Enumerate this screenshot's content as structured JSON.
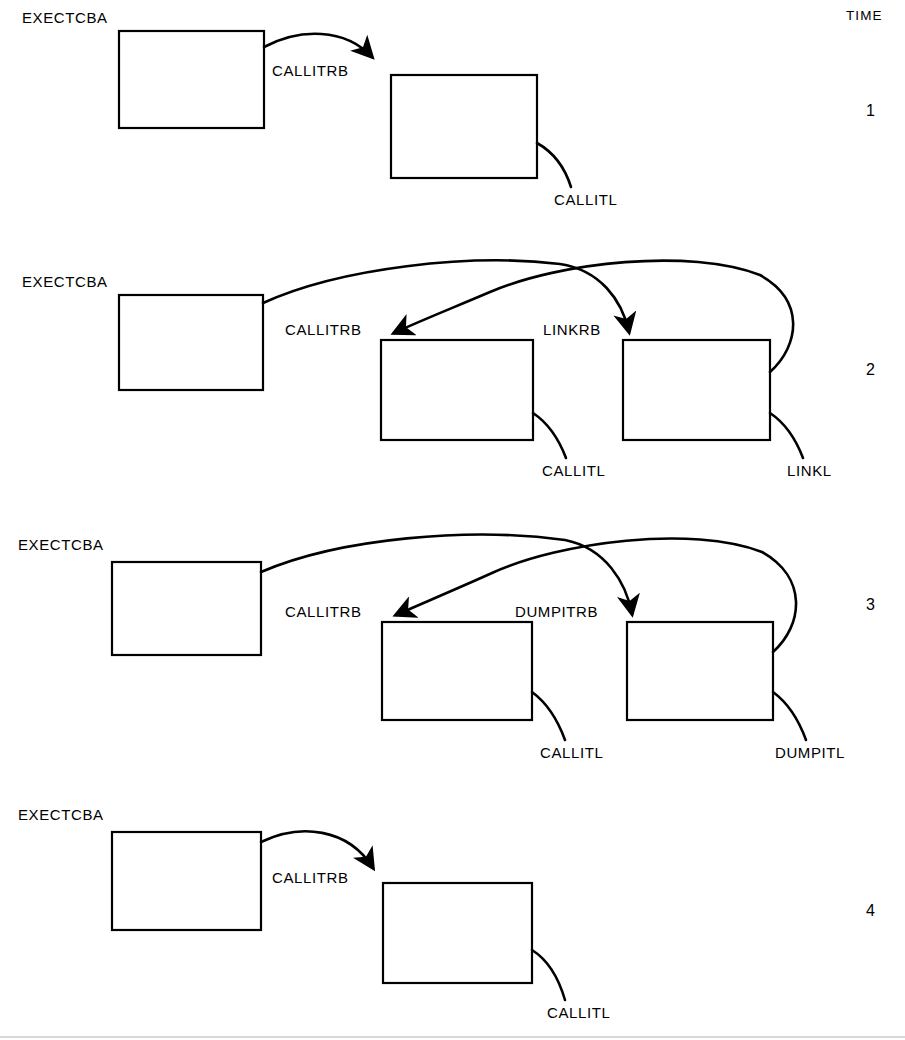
{
  "diagram": {
    "title_column": "TIME",
    "type": "control-block-sequence",
    "line_color": "#000000",
    "background": "#ffffff",
    "rows": [
      {
        "time": "1",
        "origin_label": "EXECTCBA",
        "boxes": [
          {
            "name": "exec-tcb-box",
            "x": 119,
            "y": 31,
            "w": 145,
            "h": 97
          },
          {
            "name": "request-block-box",
            "x": 391,
            "y": 75,
            "w": 146,
            "h": 103
          }
        ],
        "arc_labels": [
          "CALLITRB"
        ],
        "tail_labels": [
          "CALLITL"
        ]
      },
      {
        "time": "2",
        "origin_label": "EXECTCBA",
        "boxes": [
          {
            "name": "exec-tcb-box",
            "x": 119,
            "y": 295,
            "w": 144,
            "h": 95
          },
          {
            "name": "call-request-block-box",
            "x": 381,
            "y": 340,
            "w": 152,
            "h": 100
          },
          {
            "name": "link-request-block-box",
            "x": 623,
            "y": 340,
            "w": 147,
            "h": 100
          }
        ],
        "arc_labels": [
          "CALLITRB",
          "LINKRB"
        ],
        "tail_labels": [
          "CALLITL",
          "LINKL"
        ]
      },
      {
        "time": "3",
        "origin_label": "EXECTCBA",
        "boxes": [
          {
            "name": "exec-tcb-box",
            "x": 112,
            "y": 562,
            "w": 149,
            "h": 93
          },
          {
            "name": "call-request-block-box",
            "x": 382,
            "y": 622,
            "w": 150,
            "h": 98
          },
          {
            "name": "dumpit-request-block-box",
            "x": 627,
            "y": 622,
            "w": 146,
            "h": 98
          }
        ],
        "arc_labels": [
          "CALLITRB",
          "DUMPITRB"
        ],
        "tail_labels": [
          "CALLITL",
          "DUMPITL"
        ]
      },
      {
        "time": "4",
        "origin_label": "EXECTCBA",
        "boxes": [
          {
            "name": "exec-tcb-box",
            "x": 112,
            "y": 832,
            "w": 149,
            "h": 98
          },
          {
            "name": "call-request-block-box",
            "x": 383,
            "y": 883,
            "w": 149,
            "h": 100
          }
        ],
        "arc_labels": [
          "CALLITRB"
        ],
        "tail_labels": [
          "CALLITL"
        ]
      }
    ],
    "text_items": [
      {
        "id": "time-header",
        "text": "TIME",
        "x": 846,
        "y": 9
      },
      {
        "id": "r1-exectcba",
        "text": "EXECTCBA",
        "x": 22,
        "y": 10
      },
      {
        "id": "r1-callitrb",
        "text": "CALLITRB",
        "x": 272,
        "y": 63
      },
      {
        "id": "r1-callitl",
        "text": "CALLITL",
        "x": 554,
        "y": 192
      },
      {
        "id": "r1-time",
        "text": "1",
        "x": 866,
        "y": 103
      },
      {
        "id": "r2-exectcba",
        "text": "EXECTCBA",
        "x": 22,
        "y": 274
      },
      {
        "id": "r2-callitrb",
        "text": "CALLITRB",
        "x": 285,
        "y": 322
      },
      {
        "id": "r2-linkrb",
        "text": "LINKRB",
        "x": 543,
        "y": 322
      },
      {
        "id": "r2-callitl",
        "text": "CALLITL",
        "x": 542,
        "y": 463
      },
      {
        "id": "r2-linkl",
        "text": "LINKL",
        "x": 787,
        "y": 463
      },
      {
        "id": "r2-time",
        "text": "2",
        "x": 866,
        "y": 362
      },
      {
        "id": "r3-exectcba",
        "text": "EXECTCBA",
        "x": 18,
        "y": 537
      },
      {
        "id": "r3-callitrb",
        "text": "CALLITRB",
        "x": 285,
        "y": 604
      },
      {
        "id": "r3-dumpitrb",
        "text": "DUMPITRB",
        "x": 515,
        "y": 604
      },
      {
        "id": "r3-callitl",
        "text": "CALLITL",
        "x": 540,
        "y": 745
      },
      {
        "id": "r3-dumpitl",
        "text": "DUMPITL",
        "x": 775,
        "y": 745
      },
      {
        "id": "r3-time",
        "text": "3",
        "x": 866,
        "y": 597
      },
      {
        "id": "r4-exectcba",
        "text": "EXECTCBA",
        "x": 18,
        "y": 807
      },
      {
        "id": "r4-callitrb",
        "text": "CALLITRB",
        "x": 272,
        "y": 870
      },
      {
        "id": "r4-callitl",
        "text": "CALLITL",
        "x": 547,
        "y": 1005
      },
      {
        "id": "r4-time",
        "text": "4",
        "x": 866,
        "y": 903
      }
    ]
  }
}
